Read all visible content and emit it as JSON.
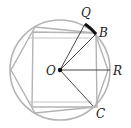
{
  "diagram": {
    "title": "",
    "labels": {
      "Q": "Q",
      "B": "B",
      "O": "O",
      "R": "R",
      "C": "C"
    },
    "colors": {
      "shape_stroke": "#b4b4b4",
      "line_stroke": "#333333",
      "arc_highlight": "#111111",
      "background": "#ffffff"
    },
    "shapes": [
      "circle",
      "inscribed square",
      "inscribed hexagon"
    ],
    "segments": [
      "OQ",
      "OB",
      "OR",
      "OC"
    ],
    "highlighted_arc": "QB"
  }
}
